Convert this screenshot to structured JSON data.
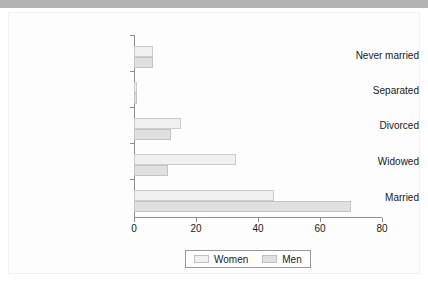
{
  "chart_data": {
    "type": "bar",
    "orientation": "horizontal",
    "title": "",
    "subtitle": "",
    "xlabel": "",
    "ylabel": "",
    "categories": [
      "Never married",
      "Separated",
      "Divorced",
      "Widowed",
      "Married"
    ],
    "series": [
      {
        "name": "Women",
        "values": [
          6,
          1,
          15,
          33,
          45
        ],
        "color": "#f0f0f0"
      },
      {
        "name": "Men",
        "values": [
          6,
          1,
          12,
          11,
          70
        ],
        "color": "#e0e0e0"
      }
    ],
    "xlim": [
      0,
      80
    ],
    "xticks": [
      0,
      20,
      40,
      60,
      80
    ],
    "xtick_labels": [
      "0",
      "20",
      "40",
      "60",
      "80"
    ],
    "grid": false,
    "legend_position": "bottom-center",
    "legend_entries": [
      "Women",
      "Men"
    ]
  },
  "legend": {
    "women_label": "Women",
    "men_label": "Men"
  },
  "axis": {
    "tick_0": "0",
    "tick_20": "20",
    "tick_40": "40",
    "tick_60": "60",
    "tick_80": "80"
  },
  "categories": {
    "never_married": "Never married",
    "separated": "Separated",
    "divorced": "Divorced",
    "widowed": "Widowed",
    "married": "Married"
  }
}
